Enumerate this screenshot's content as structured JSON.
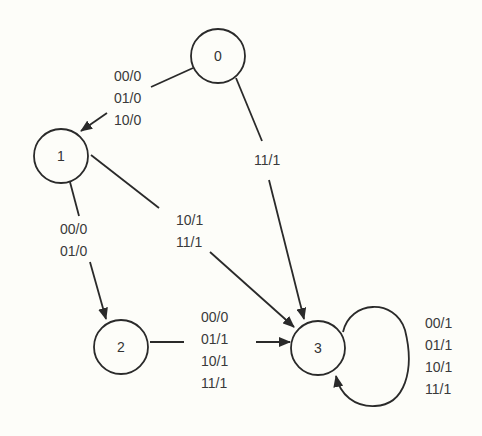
{
  "diagram": {
    "type": "state-machine",
    "background": "#fdfdf9",
    "stroke_color": "#2a2a2a",
    "nodes": [
      {
        "id": "0",
        "label": "0",
        "cx": 218,
        "cy": 56,
        "r": 27
      },
      {
        "id": "1",
        "label": "1",
        "cx": 61,
        "cy": 156,
        "r": 27
      },
      {
        "id": "2",
        "label": "2",
        "cx": 121,
        "cy": 347,
        "r": 27
      },
      {
        "id": "3",
        "label": "3",
        "cx": 318,
        "cy": 348,
        "r": 27
      }
    ],
    "edges": [
      {
        "from": "0",
        "to": "1",
        "labels": [
          "00/0",
          "01/0",
          "10/0"
        ]
      },
      {
        "from": "0",
        "to": "3",
        "labels": [
          "11/1"
        ]
      },
      {
        "from": "1",
        "to": "2",
        "labels": [
          "00/0",
          "01/0"
        ]
      },
      {
        "from": "1",
        "to": "3",
        "labels": [
          "10/1",
          "11/1"
        ]
      },
      {
        "from": "2",
        "to": "3",
        "labels": [
          "00/0",
          "01/1",
          "10/1",
          "11/1"
        ]
      },
      {
        "from": "3",
        "to": "3",
        "labels": [
          "00/1",
          "01/1",
          "10/1",
          "11/1"
        ]
      }
    ]
  }
}
